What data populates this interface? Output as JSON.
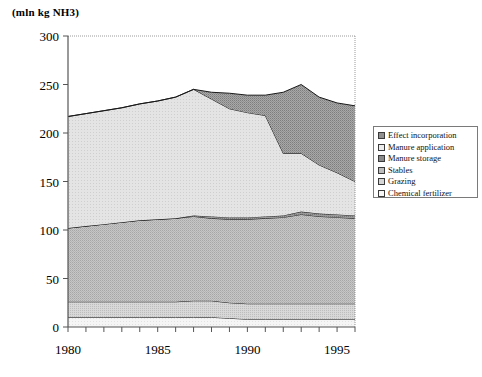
{
  "chart_data": {
    "type": "area",
    "title": "",
    "subtitle": "",
    "ylabel": "(mln kg NH3)",
    "xlabel": "",
    "ylim": [
      0,
      300
    ],
    "xlim": [
      1980,
      1996
    ],
    "yticks": [
      0,
      50,
      100,
      150,
      200,
      250,
      300
    ],
    "xticks": [
      1980,
      1981,
      1982,
      1983,
      1984,
      1985,
      1986,
      1987,
      1988,
      1989,
      1990,
      1991,
      1992,
      1993,
      1994,
      1995,
      1996
    ],
    "xtick_labels": [
      "1980",
      "",
      "",
      "",
      "",
      "1985",
      "",
      "",
      "",
      "",
      "1990",
      "",
      "",
      "",
      "",
      "1995",
      ""
    ],
    "grid": false,
    "stacked": true,
    "legend_position": "right",
    "x": [
      1980,
      1981,
      1982,
      1983,
      1984,
      1985,
      1986,
      1987,
      1988,
      1989,
      1990,
      1991,
      1992,
      1993,
      1994,
      1995,
      1996
    ],
    "series": [
      {
        "name": "Chemical fertilizer",
        "values": [
          10,
          10,
          10,
          10,
          10,
          10,
          10,
          10,
          10,
          9,
          8,
          8,
          8,
          8,
          8,
          8,
          8
        ]
      },
      {
        "name": "Grazing",
        "values": [
          16,
          16,
          16,
          16,
          16,
          16,
          16,
          17,
          17,
          16,
          16,
          16,
          16,
          16,
          16,
          16,
          16
        ]
      },
      {
        "name": "Stables",
        "values": [
          76,
          78,
          80,
          82,
          84,
          85,
          86,
          87,
          85,
          86,
          87,
          88,
          89,
          92,
          90,
          89,
          88
        ]
      },
      {
        "name": "Manure storage",
        "values": [
          0,
          0,
          0,
          0,
          0,
          0,
          0,
          1,
          2,
          2,
          2,
          2,
          2,
          3,
          3,
          3,
          3
        ]
      },
      {
        "name": "Manure application",
        "values": [
          115,
          116,
          117,
          118,
          120,
          122,
          125,
          130,
          121,
          112,
          108,
          104,
          64,
          60,
          50,
          43,
          35
        ]
      },
      {
        "name": "Effect incorporation",
        "values": [
          0,
          0,
          0,
          0,
          0,
          0,
          0,
          0,
          7,
          16,
          18,
          21,
          63,
          71,
          70,
          72,
          78
        ]
      }
    ],
    "cumulative_top": [
      217,
      220,
      223,
      226,
      230,
      233,
      237,
      245,
      242,
      241,
      239,
      239,
      242,
      250,
      237,
      231,
      228
    ],
    "series_colors": {
      "Chemical fertilizer": "#f2f2f2",
      "Grazing": "#c9c9c9",
      "Stables": "#b4b4b4",
      "Manure storage": "#8e8e8e",
      "Manure application": "#dcdcdc",
      "Effect incorporation": "#9a9a9a"
    }
  },
  "legend": {
    "items": [
      {
        "label": "Effect incorporation",
        "key": "Effect incorporation"
      },
      {
        "label": "Manure application",
        "key": "Manure application"
      },
      {
        "label": "Manure storage",
        "key": "Manure storage"
      },
      {
        "label": "Stables",
        "key": "Stables"
      },
      {
        "label": "Grazing",
        "key": "Grazing"
      },
      {
        "label": "Chemical fertilizer",
        "key": "Chemical fertilizer"
      }
    ]
  },
  "axis": {
    "y_title": "(mln kg NH3)",
    "y_labels": [
      "300",
      "250",
      "200",
      "150",
      "100",
      "50",
      "0"
    ],
    "x_labels": [
      "1980",
      "1985",
      "1990",
      "1995"
    ]
  }
}
